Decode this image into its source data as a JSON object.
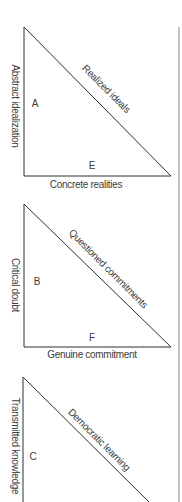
{
  "diagram": {
    "divider": {
      "x": 179,
      "y_top": 27,
      "y_bottom": 502,
      "color": "#9a9a9a"
    },
    "triangles": [
      {
        "id": "triangle-1",
        "vertical_label": "Abstract idealization",
        "diagonal_label": "Realized ideals",
        "bottom_label": "Concrete realities",
        "inner_letter": "A",
        "bottom_letter": "E"
      },
      {
        "id": "triangle-2",
        "vertical_label": "Critical doubt",
        "diagonal_label": "Questioned commitments",
        "bottom_label": "Genuine commitment",
        "inner_letter": "B",
        "bottom_letter": "F"
      },
      {
        "id": "triangle-3",
        "vertical_label": "Transmitted knowledge",
        "diagonal_label": "Democratic learning",
        "bottom_label": "",
        "inner_letter": "C",
        "bottom_letter": ""
      }
    ]
  }
}
